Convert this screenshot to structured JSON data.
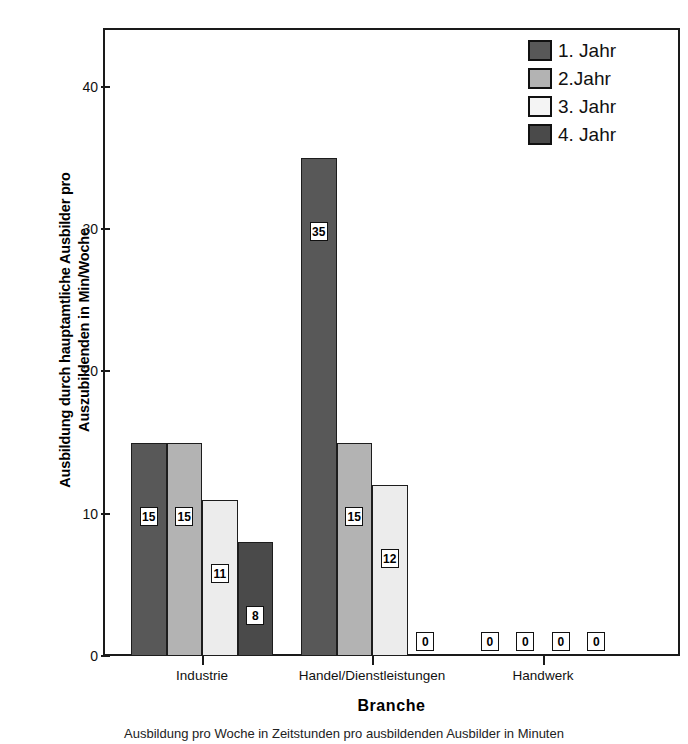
{
  "chart_data": {
    "type": "bar",
    "title": "",
    "xlabel": "Branche",
    "ylabel": "Ausbildung durch hauptamtliche Ausbilder pro Auszubildenden in Min/Woche",
    "categories": [
      "Industrie",
      "Handel/Dienstleistungen",
      "Handwerk"
    ],
    "series": [
      {
        "name": "1. Jahr",
        "values": [
          15,
          35,
          0
        ],
        "color": "#585858"
      },
      {
        "name": "2.Jahr",
        "values": [
          15,
          15,
          0
        ],
        "color": "#b3b3b3"
      },
      {
        "name": "3. Jahr",
        "values": [
          11,
          12,
          0
        ],
        "color": "#ececec"
      },
      {
        "name": "4. Jahr",
        "values": [
          8,
          0,
          0
        ],
        "color": "#4a4a4a"
      }
    ],
    "data_labels": [
      [
        "15",
        "15",
        "11",
        "8"
      ],
      [
        "35",
        "15",
        "12",
        "0"
      ],
      [
        "0",
        "0",
        "0",
        "0"
      ]
    ],
    "ylim": [
      0,
      44
    ],
    "yticks": [
      0,
      10,
      20,
      30,
      40
    ],
    "ytick_labels": [
      "0",
      "10",
      "20",
      "30",
      "40"
    ],
    "grid": false,
    "legend_position": "top-right"
  },
  "caption": "Ausbildung pro Woche in Zeitstunden pro ausbildenden Ausbilder in Minuten",
  "y_axis": {
    "title_line1": "Ausbildung durch hauptamtliche Ausbilder pro",
    "title_line2": "Auszubildenden in Min/Woche"
  },
  "x_axis": {
    "title": "Branche"
  },
  "legend": {
    "items": [
      {
        "label": "1. Jahr"
      },
      {
        "label": "2.Jahr"
      },
      {
        "label": "3. Jahr"
      },
      {
        "label": "4. Jahr"
      }
    ]
  }
}
